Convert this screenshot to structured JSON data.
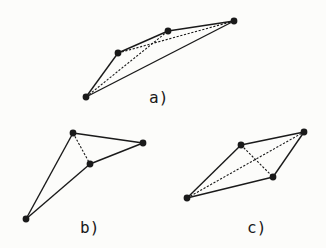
{
  "figure": {
    "background": "#fcfcfa",
    "ink_color": "#1a1a1a",
    "panels": [
      {
        "id": "a",
        "label": "a)",
        "label_pos": [
          149,
          90
        ],
        "vertices": [
          [
            86,
            97
          ],
          [
            118,
            53
          ],
          [
            168,
            31
          ],
          [
            234,
            21
          ]
        ],
        "solid_edges": [
          [
            0,
            1
          ],
          [
            1,
            2
          ],
          [
            2,
            3
          ],
          [
            0,
            3
          ]
        ],
        "dashed_edges": [
          [
            0,
            2
          ],
          [
            1,
            3
          ]
        ]
      },
      {
        "id": "b",
        "label": "b)",
        "label_pos": [
          80,
          220
        ],
        "vertices": [
          [
            73,
            133
          ],
          [
            143,
            143
          ],
          [
            90,
            164
          ],
          [
            26,
            219
          ]
        ],
        "solid_edges": [
          [
            0,
            1
          ],
          [
            0,
            3
          ],
          [
            3,
            2
          ],
          [
            2,
            1
          ]
        ],
        "dashed_edges": [
          [
            0,
            2
          ]
        ]
      },
      {
        "id": "c",
        "label": "c)",
        "label_pos": [
          247,
          220
        ],
        "vertices": [
          [
            187,
            198
          ],
          [
            241,
            145
          ],
          [
            304,
            132
          ],
          [
            273,
            177
          ]
        ],
        "solid_edges": [
          [
            0,
            1
          ],
          [
            1,
            2
          ],
          [
            2,
            3
          ],
          [
            3,
            0
          ]
        ],
        "dashed_edges": [
          [
            0,
            2
          ],
          [
            1,
            3
          ]
        ]
      }
    ]
  }
}
